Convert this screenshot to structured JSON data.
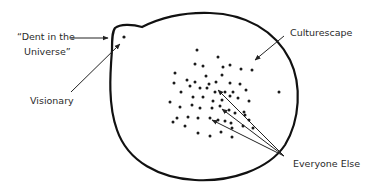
{
  "labels": {
    "dent_line1": "“Dent in the",
    "dent_line2": "Universe”",
    "visionary": "Visionary",
    "culturescape": "Culturescape",
    "everyone_else": "Everyone Else"
  },
  "colors": {
    "ink": "#111111",
    "text": "#2a2a2a",
    "background": "#ffffff"
  }
}
